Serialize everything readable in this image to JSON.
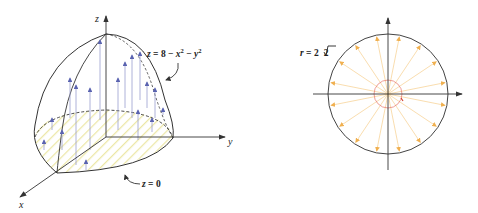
{
  "figure_left": {
    "title": "Paraboloid over disk with upward flux arrows",
    "axis_labels": {
      "x": "x",
      "y": "y",
      "z": "z"
    },
    "surface_label": {
      "lhs": "z",
      "eq": " = ",
      "const": "8",
      "minus1": " − ",
      "x": "x",
      "x_exp": "2",
      "minus2": " − ",
      "y": "y",
      "y_exp": "2"
    },
    "base_label": {
      "lhs": "z",
      "eq": " = ",
      "val": "0"
    },
    "colors": {
      "outline": "#333333",
      "arrows": "#8a8fc4",
      "arrowheads": "#5a63b0",
      "hatch": "#e8e4a8"
    }
  },
  "figure_right": {
    "title": "Disk of radius 2√2 with outward radial arrows",
    "radius_label": {
      "lhs": "r",
      "eq": " = ",
      "coef": "2",
      "radicand": "2"
    },
    "arrow_count": 16,
    "colors": {
      "circle": "#444444",
      "arrows": "#f5c77e",
      "inner_circle": "#e8847a",
      "axes": "#333333"
    }
  }
}
